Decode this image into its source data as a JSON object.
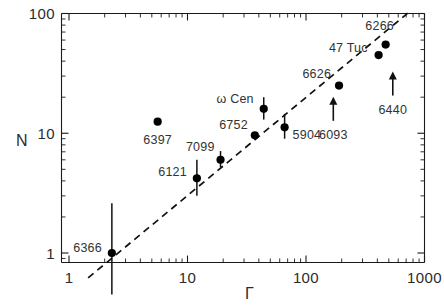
{
  "figure": {
    "background": "#ffffff",
    "ink_color": "#1a1a1a"
  },
  "chart_data": {
    "type": "scatter",
    "title": "",
    "xlabel": "Γ",
    "ylabel": "N",
    "xscale": "log",
    "yscale": "log",
    "xlim": [
      1,
      1000
    ],
    "ylim": [
      0.62,
      130
    ],
    "grid": false,
    "legend": null,
    "xticks": [
      "1",
      "10",
      "100",
      "1000"
    ],
    "xtick_values": [
      1,
      10,
      100,
      1000
    ],
    "yticks": [
      "1",
      "10",
      "100"
    ],
    "ytick_values": [
      1,
      10,
      100
    ],
    "fit_line": {
      "style": "dashed",
      "x": [
        1.45,
        760
      ],
      "y": [
        0.62,
        105
      ],
      "description": "dashed power-law fit"
    },
    "points": [
      {
        "label": "6366",
        "x": 2.3,
        "y": 1.0,
        "yerr_low": 0.45,
        "yerr_high": 2.6,
        "limit": false,
        "label_pos": "left"
      },
      {
        "label": "6397",
        "x": 5.6,
        "y": 12.5,
        "yerr_low": 12.5,
        "yerr_high": 12.5,
        "limit": false,
        "label_pos": "below"
      },
      {
        "label": "6121",
        "x": 12.0,
        "y": 4.2,
        "yerr_low": 3.0,
        "yerr_high": 6.0,
        "limit": false,
        "label_pos": "left"
      },
      {
        "label": "7099",
        "x": 19.0,
        "y": 6.0,
        "yerr_low": 5.2,
        "yerr_high": 7.1,
        "limit": false,
        "label_pos": "above-left"
      },
      {
        "label": "6752",
        "x": 37.0,
        "y": 9.6,
        "yerr_low": 9.6,
        "yerr_high": 9.6,
        "limit": false,
        "label_pos": "left"
      },
      {
        "label": "ω Cen",
        "x": 44.0,
        "y": 16.0,
        "yerr_low": 13.0,
        "yerr_high": 20.0,
        "limit": false,
        "label_pos": "above-left"
      },
      {
        "label": "5904",
        "x": 66.0,
        "y": 11.2,
        "yerr_low": 9.0,
        "yerr_high": 14.5,
        "limit": false,
        "label_pos": "right"
      },
      {
        "label": "6626",
        "x": 190.0,
        "y": 25.0,
        "yerr_low": 25.0,
        "yerr_high": 25.0,
        "limit": false,
        "label_pos": "above-left"
      },
      {
        "label": "47 Tuc",
        "x": 410.0,
        "y": 45.0,
        "yerr_low": 45.0,
        "yerr_high": 45.0,
        "limit": false,
        "label_pos": "above-left"
      },
      {
        "label": "6266",
        "x": 470.0,
        "y": 55.0,
        "yerr_low": 55.0,
        "yerr_high": 55.0,
        "limit": false,
        "label_pos": "above"
      },
      {
        "label": "6093",
        "x": 170.0,
        "y": 16.0,
        "limit": true,
        "limit_dir": "lower",
        "label_pos": "below"
      },
      {
        "label": "6440",
        "x": 540.0,
        "y": 26.0,
        "limit": true,
        "limit_dir": "lower",
        "label_pos": "below"
      }
    ]
  },
  "labels": {
    "y_axis_title": "N",
    "x_axis_title": "Γ"
  }
}
